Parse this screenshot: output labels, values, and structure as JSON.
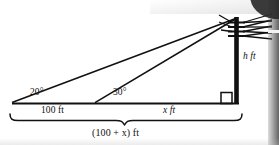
{
  "figure": {
    "type": "geometry-diagram",
    "colors": {
      "ink": "#111111",
      "background": "#ffffff",
      "edge_artifact": "#2a2a2a"
    },
    "labels": {
      "angle_left": "20°",
      "angle_left_value": "20",
      "angle_mid": "30°",
      "angle_mid_value": "30",
      "base_left_segment": "100 ft",
      "base_right_segment": "x ft",
      "base_total": "(100 + x) ft",
      "height": "h ft"
    },
    "parts": {
      "pole_name": "utility-pole",
      "crossarm_count": "4",
      "right_angle_marker": "right-angle-square",
      "brace_label": "total-base-brace"
    }
  }
}
